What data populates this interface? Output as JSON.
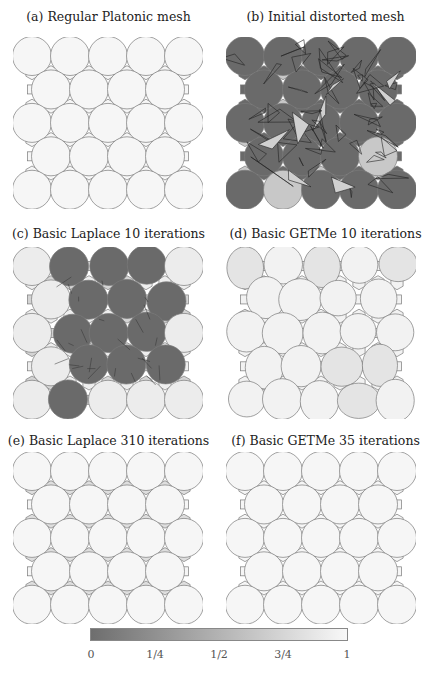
{
  "figure": {
    "panels": [
      {
        "id": "a",
        "caption": "(a) Regular Platonic mesh",
        "state": "regular"
      },
      {
        "id": "b",
        "caption": "(b) Initial distorted mesh",
        "state": "distorted"
      },
      {
        "id": "c",
        "caption": "(c) Basic Laplace 10 iterations",
        "state": "laplace10"
      },
      {
        "id": "d",
        "caption": "(d) Basic GETMe 10 iterations",
        "state": "getme10"
      },
      {
        "id": "e",
        "caption": "(e) Basic Laplace 310 iterations",
        "state": "laplace310"
      },
      {
        "id": "f",
        "caption": "(f) Basic GETMe 35 iterations",
        "state": "getme35"
      }
    ],
    "colorbar": {
      "ticks": [
        "0",
        "1/4",
        "1/2",
        "3/4",
        "1"
      ],
      "color_low": "#6e6e6e",
      "color_high": "#f8f8f8"
    },
    "colors": {
      "edge": "#7a7a7a",
      "fill_good": "#f6f6f6",
      "fill_bad": "#6a6a6a",
      "fill_mid": "#d8d8d8"
    }
  }
}
